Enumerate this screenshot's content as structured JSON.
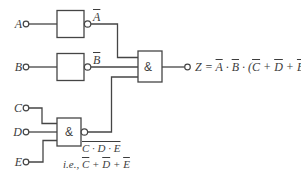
{
  "diagram": {
    "kind": "logic-circuit",
    "colors": {
      "background": "#ffffff",
      "line": "#454545",
      "text": "#3d3d3d"
    },
    "inputs": [
      {
        "label": "A"
      },
      {
        "label": "B"
      },
      {
        "label": "C"
      },
      {
        "label": "D"
      },
      {
        "label": "E"
      }
    ],
    "gates": {
      "not_a": {
        "type": "inverter",
        "symbol": ""
      },
      "not_b": {
        "type": "inverter",
        "symbol": ""
      },
      "nand_cde": {
        "type": "nand",
        "symbol": "&"
      },
      "and_output": {
        "type": "and",
        "symbol": "&"
      }
    },
    "wire_labels": {
      "a_bar": [
        {
          "t": "A",
          "o": true
        }
      ],
      "b_bar": [
        {
          "t": "B",
          "o": true
        }
      ],
      "cde_bar": [
        {
          "t": "C · D · E",
          "o": true
        }
      ],
      "ie_note": [
        {
          "t": "i.e., ",
          "o": false
        },
        {
          "t": "C",
          "o": true
        },
        {
          "t": " + ",
          "o": false
        },
        {
          "t": "D",
          "o": true
        },
        {
          "t": " + ",
          "o": false
        },
        {
          "t": "E",
          "o": true
        }
      ],
      "z_output": [
        {
          "t": "Z = ",
          "o": false
        },
        {
          "t": "A",
          "o": true
        },
        {
          "t": " · ",
          "o": false
        },
        {
          "t": "B",
          "o": true
        },
        {
          "t": " · (",
          "o": false
        },
        {
          "t": "C",
          "o": true
        },
        {
          "t": " + ",
          "o": false
        },
        {
          "t": "D",
          "o": true
        },
        {
          "t": " + ",
          "o": false
        },
        {
          "t": "E",
          "o": true
        },
        {
          "t": ")",
          "o": false
        }
      ]
    }
  }
}
